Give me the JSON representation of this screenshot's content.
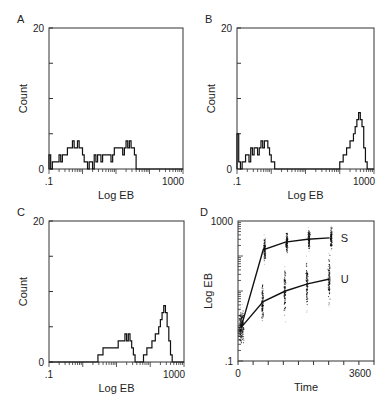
{
  "figure": {
    "panels": [
      "A",
      "B",
      "C",
      "D"
    ]
  },
  "chart_data": [
    {
      "panel": "A",
      "type": "area",
      "subtype": "histogram",
      "title": "",
      "xlabel": "Log EB",
      "ylabel": "Count",
      "xscale": "log",
      "xlim": [
        0.1,
        1000
      ],
      "ylim": [
        0,
        20
      ],
      "x_tick_labels": [
        ".1",
        "1000"
      ],
      "y_tick_labels": [
        "0",
        "20"
      ],
      "grid": false,
      "legend": null,
      "bins_log10": [
        -1.0,
        -0.95,
        -0.9,
        -0.85,
        -0.8,
        -0.75,
        -0.7,
        -0.65,
        -0.6,
        -0.55,
        -0.5,
        -0.45,
        -0.4,
        -0.35,
        -0.3,
        -0.25,
        -0.2,
        -0.15,
        -0.1,
        -0.05,
        0.0,
        0.05,
        0.1,
        0.15,
        0.2,
        0.25,
        0.3,
        0.35,
        0.4,
        0.45,
        0.5,
        0.55,
        0.6,
        0.65,
        0.7,
        0.75,
        0.8,
        0.85,
        0.9,
        0.95,
        1.0,
        1.05,
        1.1,
        1.15,
        1.2,
        1.25,
        1.3,
        1.35,
        1.4,
        1.45,
        1.5,
        1.55,
        1.6,
        1.65,
        1.7,
        1.75,
        1.8,
        1.85,
        1.9,
        1.95,
        2.0,
        2.05,
        2.1,
        2.15,
        2.2,
        2.25,
        2.3,
        2.35,
        2.4,
        2.45,
        2.5,
        2.55,
        2.6,
        2.65,
        2.7,
        2.75,
        2.8,
        2.85,
        2.9,
        2.95,
        3.0
      ],
      "counts": [
        2,
        0,
        1,
        1,
        1,
        1,
        2,
        1,
        2,
        2,
        2,
        3,
        3,
        3,
        4,
        3,
        3,
        4,
        3,
        3,
        2,
        1,
        1,
        0,
        1,
        1,
        0,
        2,
        1,
        2,
        2,
        1,
        2,
        2,
        2,
        2,
        2,
        1,
        2,
        3,
        3,
        3,
        3,
        3,
        2,
        3,
        4,
        3,
        4,
        3,
        3,
        2,
        0,
        0,
        0,
        0,
        0,
        0,
        0,
        0,
        0,
        0,
        0,
        0,
        0,
        0,
        0,
        0,
        0,
        0,
        0,
        0,
        0,
        0,
        0,
        0,
        0,
        0,
        0,
        0,
        0
      ]
    },
    {
      "panel": "B",
      "type": "area",
      "subtype": "histogram",
      "title": "",
      "xlabel": "Log EB",
      "ylabel": "Count",
      "xscale": "log",
      "xlim": [
        0.1,
        1000
      ],
      "ylim": [
        0,
        20
      ],
      "x_tick_labels": [
        ".1",
        "1000"
      ],
      "y_tick_labels": [
        "0",
        "20"
      ],
      "grid": false,
      "legend": null,
      "bins_log10": [
        -1.0,
        -0.95,
        -0.9,
        -0.85,
        -0.8,
        -0.75,
        -0.7,
        -0.65,
        -0.6,
        -0.55,
        -0.5,
        -0.45,
        -0.4,
        -0.35,
        -0.3,
        -0.25,
        -0.2,
        -0.15,
        -0.1,
        -0.05,
        0.0,
        0.05,
        0.1,
        0.15,
        0.2,
        0.25,
        0.3,
        0.35,
        0.4,
        0.45,
        0.5,
        0.55,
        0.6,
        0.65,
        0.7,
        0.75,
        0.8,
        0.85,
        0.9,
        0.95,
        1.0,
        1.05,
        1.1,
        1.15,
        1.2,
        1.25,
        1.3,
        1.35,
        1.4,
        1.45,
        1.5,
        1.55,
        1.6,
        1.65,
        1.7,
        1.75,
        1.8,
        1.85,
        1.9,
        1.95,
        2.0,
        2.05,
        2.1,
        2.15,
        2.2,
        2.25,
        2.3,
        2.35,
        2.4,
        2.45,
        2.5,
        2.55,
        2.6,
        2.65,
        2.7,
        2.75,
        2.8,
        2.85,
        2.9,
        2.95,
        3.0
      ],
      "counts": [
        5,
        1,
        0,
        1,
        1,
        2,
        2,
        1,
        3,
        2,
        3,
        3,
        2,
        3,
        4,
        3,
        4,
        4,
        3,
        2,
        1,
        1,
        0,
        0,
        0,
        0,
        0,
        0,
        0,
        0,
        0,
        0,
        0,
        0,
        0,
        0,
        0,
        0,
        0,
        0,
        0,
        0,
        0,
        0,
        0,
        0,
        0,
        0,
        0,
        0,
        0,
        0,
        0,
        0,
        0,
        0,
        0,
        0,
        0,
        0,
        1,
        1,
        2,
        2,
        3,
        3,
        4,
        4,
        5,
        6,
        7,
        8,
        7,
        6,
        3,
        1,
        0,
        0,
        0,
        0,
        0
      ]
    },
    {
      "panel": "C",
      "type": "area",
      "subtype": "histogram",
      "title": "",
      "xlabel": "Log EB",
      "ylabel": "Count",
      "xscale": "log",
      "xlim": [
        0.1,
        1000
      ],
      "ylim": [
        0,
        20
      ],
      "x_tick_labels": [
        ".1",
        "1000"
      ],
      "y_tick_labels": [
        "0",
        "20"
      ],
      "grid": false,
      "legend": null,
      "bins_log10": [
        -1.0,
        -0.95,
        -0.9,
        -0.85,
        -0.8,
        -0.75,
        -0.7,
        -0.65,
        -0.6,
        -0.55,
        -0.5,
        -0.45,
        -0.4,
        -0.35,
        -0.3,
        -0.25,
        -0.2,
        -0.15,
        -0.1,
        -0.05,
        0.0,
        0.05,
        0.1,
        0.15,
        0.2,
        0.25,
        0.3,
        0.35,
        0.4,
        0.45,
        0.5,
        0.55,
        0.6,
        0.65,
        0.7,
        0.75,
        0.8,
        0.85,
        0.9,
        0.95,
        1.0,
        1.05,
        1.1,
        1.15,
        1.2,
        1.25,
        1.3,
        1.35,
        1.4,
        1.45,
        1.5,
        1.55,
        1.6,
        1.65,
        1.7,
        1.75,
        1.8,
        1.85,
        1.9,
        1.95,
        2.0,
        2.05,
        2.1,
        2.15,
        2.2,
        2.25,
        2.3,
        2.35,
        2.4,
        2.45,
        2.5,
        2.55,
        2.6,
        2.65,
        2.7,
        2.75,
        2.8,
        2.85,
        2.9,
        2.95,
        3.0
      ],
      "counts": [
        0,
        0,
        0,
        0,
        0,
        0,
        0,
        0,
        0,
        0,
        0,
        0,
        0,
        0,
        0,
        0,
        0,
        0,
        0,
        0,
        0,
        0,
        0,
        0,
        0,
        0,
        0,
        0,
        0,
        1,
        1,
        1,
        2,
        2,
        2,
        2,
        2,
        2,
        2,
        2,
        2,
        3,
        3,
        3,
        3,
        4,
        3,
        4,
        3,
        2,
        1,
        0,
        0,
        0,
        0,
        0,
        1,
        1,
        2,
        2,
        2,
        3,
        3,
        4,
        4,
        5,
        6,
        7,
        8,
        7,
        5,
        3,
        1,
        0,
        0,
        0,
        0,
        0,
        0,
        0,
        0
      ]
    },
    {
      "panel": "D",
      "type": "scatter",
      "subtype": "scatter-with-mean-lines",
      "title": "",
      "xlabel": "Time",
      "ylabel": "Log EB",
      "xscale": "linear",
      "yscale": "log",
      "xlim": [
        0,
        3600
      ],
      "ylim": [
        0.1,
        1000
      ],
      "x_tick_labels": [
        "0",
        "3600"
      ],
      "y_tick_labels": [
        ".1",
        "1000"
      ],
      "x_major_ticks": [
        0,
        400,
        800,
        1200,
        1600,
        2000,
        2400,
        2800,
        3200,
        3600
      ],
      "grid": false,
      "legend": null,
      "series": [
        {
          "name": "S",
          "x": [
            0,
            600,
            1200,
            1800,
            2400
          ],
          "y": [
            0.9,
            150,
            250,
            300,
            330
          ],
          "spread_log10": [
            0.5,
            0.35,
            0.3,
            0.3,
            0.3
          ]
        },
        {
          "name": "U",
          "x": [
            0,
            600,
            1200,
            1800,
            2400
          ],
          "y": [
            0.9,
            5,
            10,
            16,
            22
          ],
          "spread_log10": [
            0.5,
            0.5,
            0.65,
            0.65,
            0.7
          ]
        }
      ]
    }
  ]
}
